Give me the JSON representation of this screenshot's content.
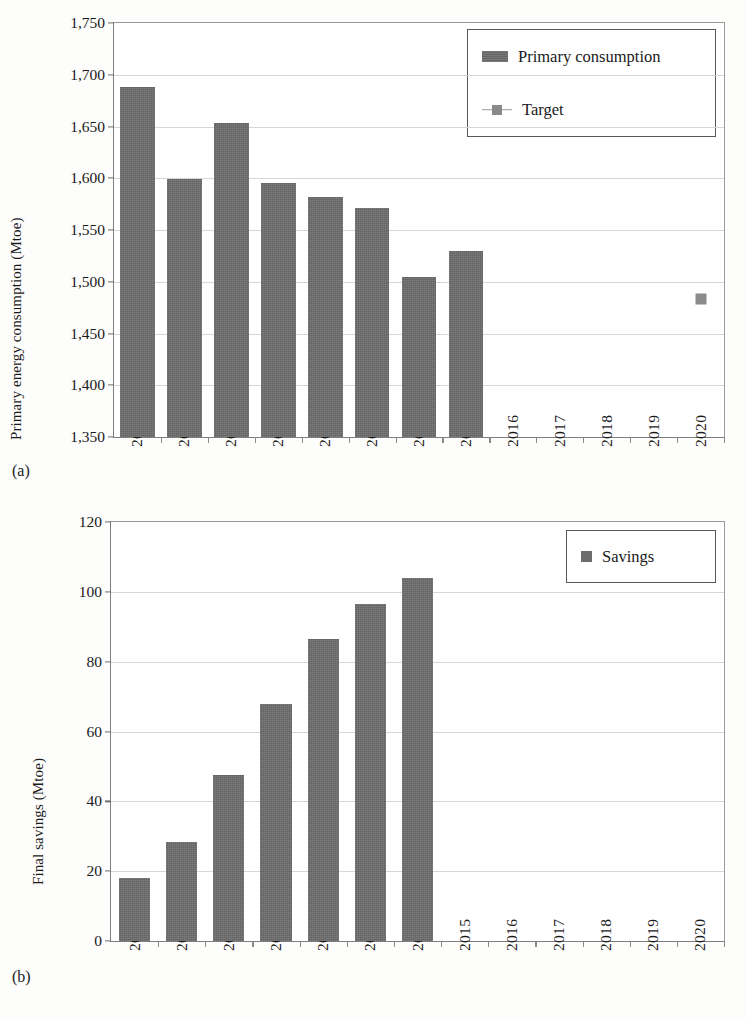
{
  "figure": {
    "panel_a_letter": "(a)",
    "panel_b_letter": "(b)"
  },
  "chart_data": [
    {
      "id": "panel-a",
      "type": "bar",
      "title": "",
      "xlabel": "",
      "ylabel": "Primary energy consumption (Mtoe)",
      "ylim": [
        1350,
        1750
      ],
      "ytick_step": 50,
      "ytick_labels": [
        "1,750",
        "1,700",
        "1,650",
        "1,600",
        "1,550",
        "1,500",
        "1,450",
        "1,400",
        "1,350"
      ],
      "ytick_values": [
        1750,
        1700,
        1650,
        1600,
        1550,
        1500,
        1450,
        1400,
        1350
      ],
      "grid": true,
      "legend_position": "top-right",
      "categories": [
        "2008",
        "2009",
        "2010",
        "2011",
        "2012",
        "2013",
        "2014",
        "2015",
        "2016",
        "2017",
        "2018",
        "2019",
        "2020"
      ],
      "series": [
        {
          "name": "Primary consumption",
          "kind": "bar",
          "values": [
            1688,
            1599,
            1653,
            1595,
            1582,
            1571,
            1505,
            1530,
            null,
            null,
            null,
            null,
            null
          ]
        },
        {
          "name": "Target",
          "kind": "marker",
          "values": [
            null,
            null,
            null,
            null,
            null,
            null,
            null,
            null,
            null,
            null,
            null,
            null,
            1483
          ]
        }
      ]
    },
    {
      "id": "panel-b",
      "type": "bar",
      "title": "",
      "xlabel": "",
      "ylabel": "Final savings (Mtoe)",
      "ylim": [
        0,
        120
      ],
      "ytick_step": 20,
      "ytick_labels": [
        "120",
        "100",
        "80",
        "60",
        "40",
        "20",
        "0"
      ],
      "ytick_values": [
        120,
        100,
        80,
        60,
        40,
        20,
        0
      ],
      "grid": true,
      "legend_position": "top-right",
      "categories": [
        "2008",
        "2009",
        "2010",
        "2011",
        "2012",
        "2013",
        "2014",
        "2015",
        "2016",
        "2017",
        "2018",
        "2019",
        "2020"
      ],
      "series": [
        {
          "name": "Savings",
          "kind": "bar",
          "values": [
            18,
            28.5,
            47.5,
            68,
            86.5,
            96.5,
            104,
            null,
            null,
            null,
            null,
            null,
            null
          ]
        }
      ]
    }
  ],
  "colors": {
    "bar": "#6d6d6d",
    "marker": "#8a8a8a",
    "grid": "#d6d6d6",
    "axis": "#7e7e7e",
    "text": "#1a1a1a",
    "background": "#fdfdfc"
  }
}
